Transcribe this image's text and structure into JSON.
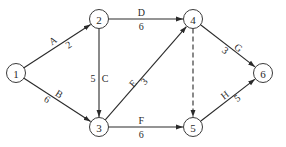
{
  "diagram": {
    "type": "activity-on-arrow network",
    "nodes": [
      {
        "id": "1",
        "label": "1"
      },
      {
        "id": "2",
        "label": "2"
      },
      {
        "id": "3",
        "label": "3"
      },
      {
        "id": "4",
        "label": "4"
      },
      {
        "id": "5",
        "label": "5"
      },
      {
        "id": "6",
        "label": "6"
      }
    ],
    "edges": [
      {
        "from": "1",
        "to": "2",
        "activity": "A",
        "duration": "2",
        "dashed": false
      },
      {
        "from": "1",
        "to": "3",
        "activity": "B",
        "duration": "6",
        "dashed": false
      },
      {
        "from": "2",
        "to": "3",
        "activity": "C",
        "duration": "5",
        "dashed": false
      },
      {
        "from": "2",
        "to": "4",
        "activity": "D",
        "duration": "6",
        "dashed": false
      },
      {
        "from": "3",
        "to": "4",
        "activity": "E",
        "duration": "3",
        "dashed": false
      },
      {
        "from": "3",
        "to": "5",
        "activity": "F",
        "duration": "6",
        "dashed": false
      },
      {
        "from": "4",
        "to": "6",
        "activity": "G",
        "duration": "3",
        "dashed": false
      },
      {
        "from": "5",
        "to": "6",
        "activity": "H",
        "duration": "5",
        "dashed": false
      },
      {
        "from": "4",
        "to": "5",
        "activity": "",
        "duration": "",
        "dashed": true
      }
    ]
  }
}
